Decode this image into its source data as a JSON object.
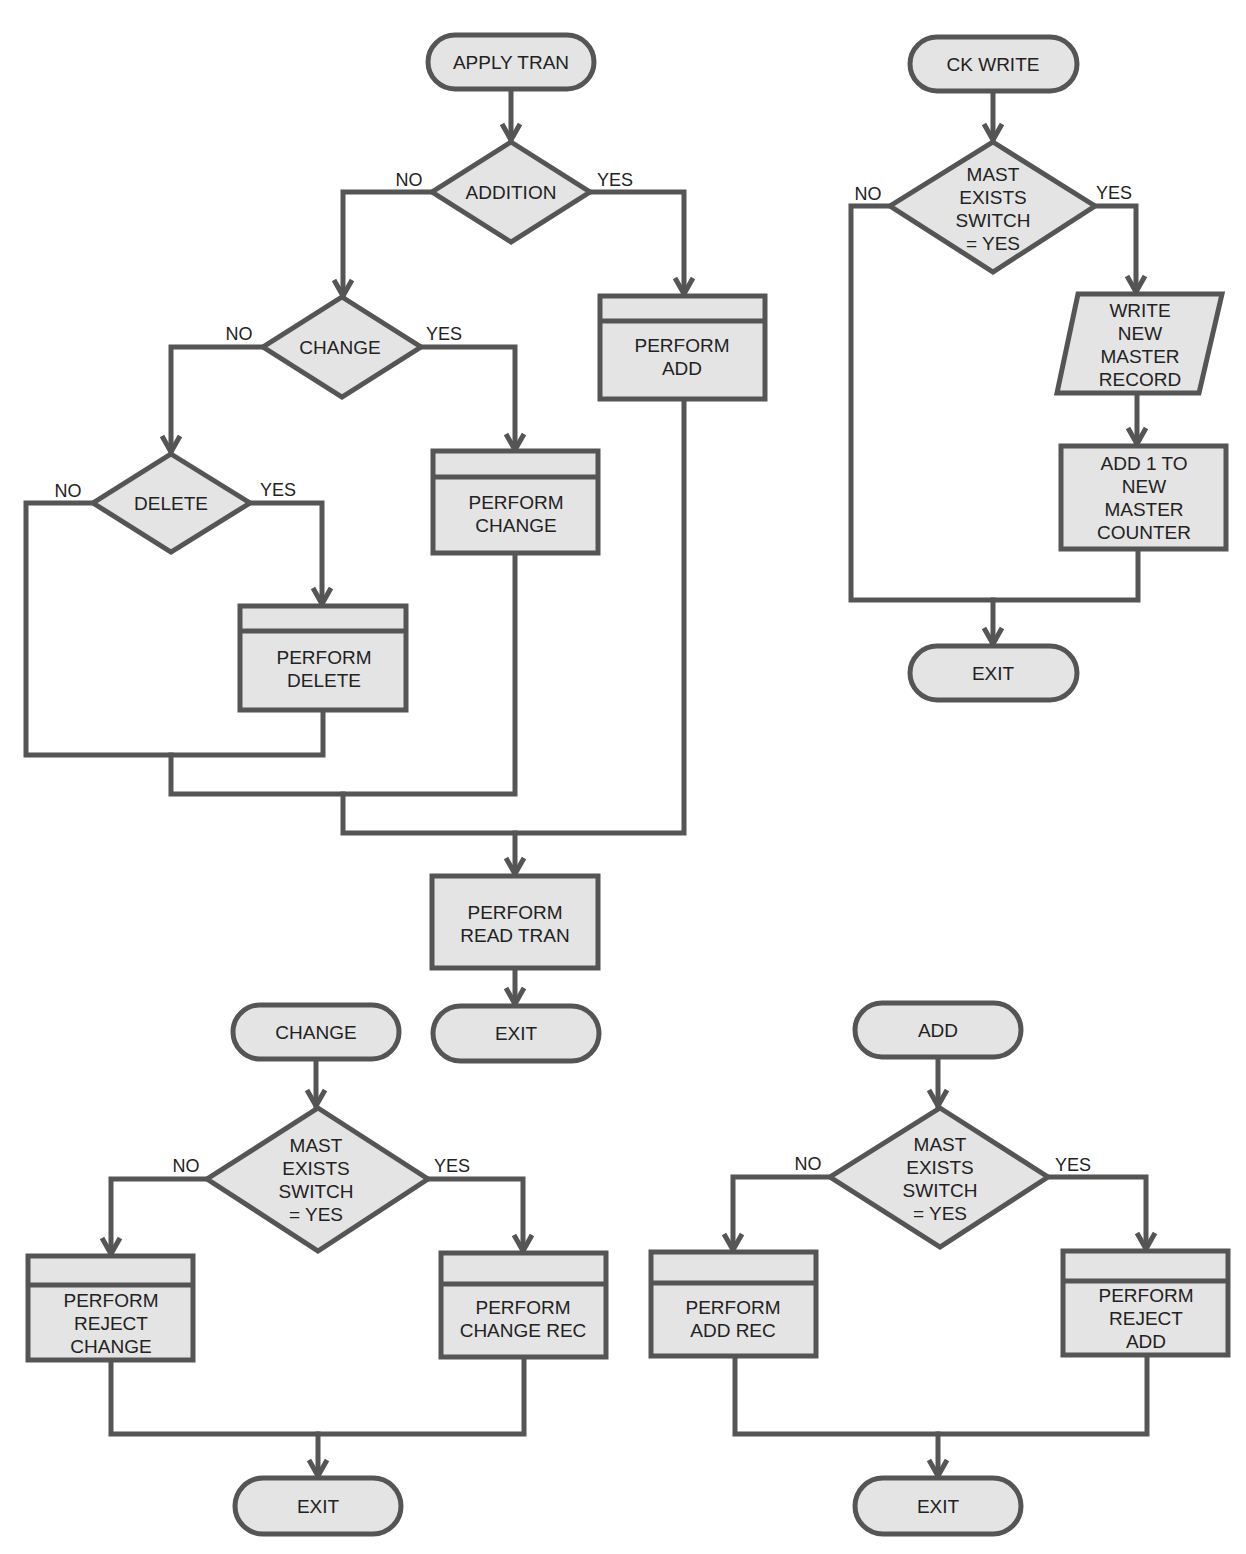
{
  "colors": {
    "shape_fill": "#e4e4e4",
    "stroke": "#555555",
    "text": "#222222",
    "background": "#ffffff"
  },
  "apply_tran": {
    "start": "APPLY TRAN",
    "addition": {
      "label": "ADDITION",
      "no": "NO",
      "yes": "YES"
    },
    "perform_add": [
      "PERFORM",
      "ADD"
    ],
    "change": {
      "label": "CHANGE",
      "no": "NO",
      "yes": "YES"
    },
    "perform_change": [
      "PERFORM",
      "CHANGE"
    ],
    "delete": {
      "label": "DELETE",
      "no": "NO",
      "yes": "YES"
    },
    "perform_delete": [
      "PERFORM",
      "DELETE"
    ],
    "perform_read_tran": [
      "PERFORM",
      "READ TRAN"
    ],
    "exit": "EXIT"
  },
  "ck_write": {
    "start": "CK WRITE",
    "decision": {
      "lines": [
        "MAST",
        "EXISTS",
        "SWITCH",
        "= YES"
      ],
      "no": "NO",
      "yes": "YES"
    },
    "write_record": [
      "WRITE",
      "NEW",
      "MASTER",
      "RECORD"
    ],
    "add_counter": [
      "ADD 1 TO",
      "NEW",
      "MASTER",
      "COUNTER"
    ],
    "exit": "EXIT"
  },
  "change_routine": {
    "start": "CHANGE",
    "decision": {
      "lines": [
        "MAST",
        "EXISTS",
        "SWITCH",
        "= YES"
      ],
      "no": "NO",
      "yes": "YES"
    },
    "reject_change": [
      "PERFORM",
      "REJECT",
      "CHANGE"
    ],
    "change_rec": [
      "PERFORM",
      "CHANGE REC"
    ],
    "exit": "EXIT"
  },
  "add_routine": {
    "start": "ADD",
    "decision": {
      "lines": [
        "MAST",
        "EXISTS",
        "SWITCH",
        "= YES"
      ],
      "no": "NO",
      "yes": "YES"
    },
    "add_rec": [
      "PERFORM",
      "ADD REC"
    ],
    "reject_add": [
      "PERFORM",
      "REJECT",
      "ADD"
    ],
    "exit": "EXIT"
  }
}
